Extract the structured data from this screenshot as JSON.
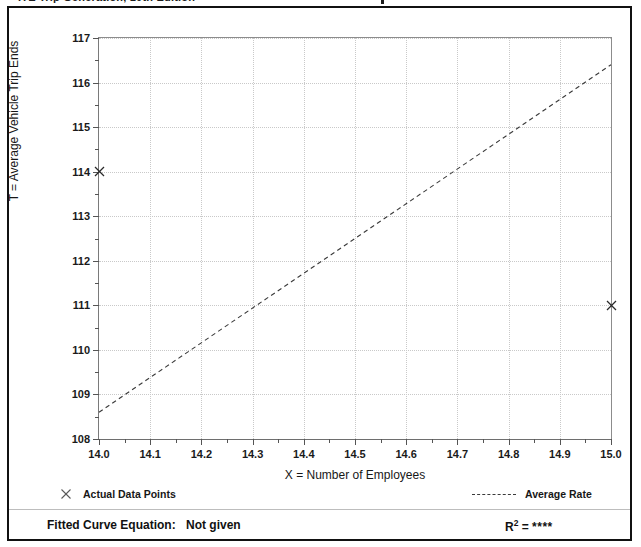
{
  "top_strip": {
    "clipped_text": "ITE Trip Generation, 10th Edition"
  },
  "chart_data": {
    "type": "scatter",
    "title": "",
    "xlabel": "X = Number of Employees",
    "ylabel": "T = Average Vehicle Trip Ends",
    "xlim": [
      14.0,
      15.0
    ],
    "ylim": [
      108,
      117
    ],
    "xticks": [
      "14.0",
      "14.1",
      "14.2",
      "14.3",
      "14.4",
      "14.5",
      "14.6",
      "14.7",
      "14.8",
      "14.9",
      "15.0"
    ],
    "xtick_values": [
      14.0,
      14.1,
      14.2,
      14.3,
      14.4,
      14.5,
      14.6,
      14.7,
      14.8,
      14.9,
      15.0
    ],
    "yticks": [
      "108",
      "109",
      "110",
      "111",
      "112",
      "113",
      "114",
      "115",
      "116",
      "117"
    ],
    "ytick_values": [
      108,
      109,
      110,
      111,
      112,
      113,
      114,
      115,
      116,
      117
    ],
    "grid": true,
    "legend_position": "below-plot",
    "series": [
      {
        "name": "Actual Data Points",
        "type": "scatter",
        "marker": "x",
        "x": [
          14.0,
          15.0
        ],
        "y": [
          114,
          111
        ]
      },
      {
        "name": "Average Rate",
        "type": "line",
        "style": "dashed",
        "x": [
          14.0,
          15.0
        ],
        "y": [
          108.6,
          116.4
        ]
      }
    ]
  },
  "legend": {
    "data_points_label": "Actual Data Points",
    "data_points_marker": "x-marker-icon",
    "average_rate_label": "Average Rate",
    "average_rate_marker": "dashed-line-icon"
  },
  "footer": {
    "fitted_curve_label": "Fitted Curve Equation:",
    "fitted_curve_value": "Not given",
    "r_squared_label": "R",
    "r_squared_exponent": "2",
    "r_squared_equals": "=",
    "r_squared_value": "****"
  },
  "colors": {
    "frame": "#111111",
    "grid": "#c9c9c9",
    "axis": "#6e6e6e",
    "line": "#3a3a3a",
    "marker": "#2a2a2a",
    "text": "#171717"
  }
}
